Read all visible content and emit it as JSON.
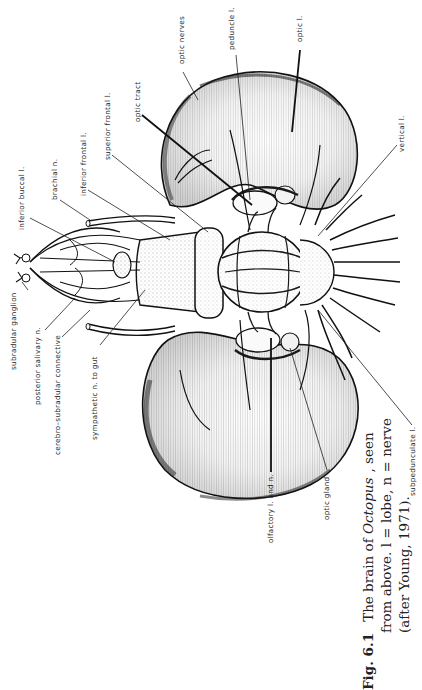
{
  "figure": {
    "number": "Fig. 6.1",
    "caption_line1_pre": "The brain of ",
    "caption_line1_italic": "Octopus",
    "caption_line1_post": ", seen",
    "caption_line2": "from above. l = lobe, n = nerve",
    "caption_line3": "(after Young, 1971).",
    "orientation": "rotated 90° counter-clockwise"
  },
  "labels": {
    "inferior_buccal": "inferior buccal l.",
    "brachial": "brachial n.",
    "inferior_frontal": "inferior frontal l.",
    "superior_frontal": "superior frontal l.",
    "optic_tract": "optic tract",
    "optic_nerves": "optic nerves",
    "peduncle": "peduncle l.",
    "optic_lobe": "optic l.",
    "vertical": "vertical l.",
    "subradular_ganglion": "subradular ganglion",
    "posterior_salivary": "posterior salivary n.",
    "cerebro_subradular": "cerebro–subradular connective",
    "sympathetic": "sympathetic n. to gut",
    "olfactory": "olfactory l. and n.",
    "optic_gland": "optic gland",
    "subpedunculate": "subpedunculate l."
  },
  "colors": {
    "ink": "#1a1a1a",
    "paper": "#ffffff"
  }
}
